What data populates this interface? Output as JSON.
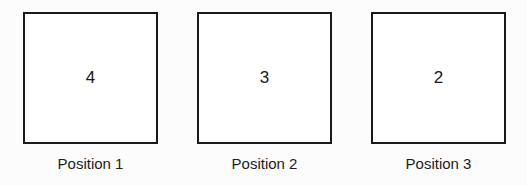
{
  "diagram": {
    "background_color": "#fcfcfc",
    "border_color": "#1a1a1a",
    "text_color": "#1c1c1c",
    "positions": [
      {
        "value": "4",
        "label": "Position 1"
      },
      {
        "value": "3",
        "label": "Position 2"
      },
      {
        "value": "2",
        "label": "Position 3"
      }
    ]
  }
}
